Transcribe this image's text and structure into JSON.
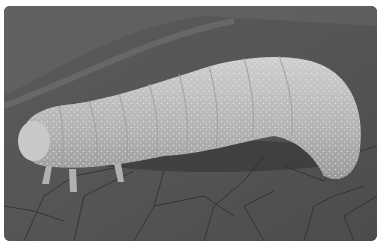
{
  "image": {
    "description": "Grayscale close-up photograph of a pale speckled caterpillar crawling on a leaf with visible vein network",
    "subject": "caterpillar",
    "background": "leaf surface with veins",
    "colors": {
      "background_page": "#ffffff",
      "leaf_dark": "#4a4a4a",
      "leaf_mid": "#666666",
      "caterpillar_body": "#b8b8b8",
      "caterpillar_highlight": "#d8d8d8",
      "vein": "#2e2e2e"
    }
  }
}
